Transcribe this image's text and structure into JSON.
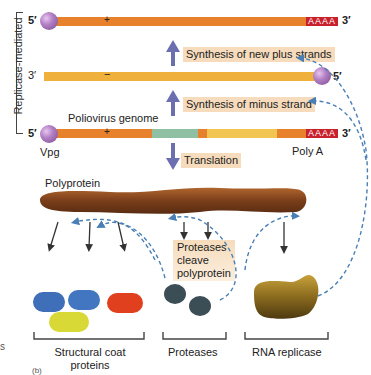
{
  "side_label": "Replicase-mediated",
  "strands": {
    "new_plus": {
      "five_prime": "5′",
      "sign": "+",
      "polyA": "AAAA",
      "three_prime": "3′"
    },
    "minus": {
      "three_prime": "3′",
      "sign": "−",
      "five_prime": "5′"
    },
    "genome": {
      "five_prime": "5′",
      "sign": "+",
      "polyA": "AAAA",
      "three_prime": "3′",
      "label": "Poliovirus genome",
      "vpg_label": "Vpg",
      "polya_label": "Poly A"
    }
  },
  "steps": {
    "plus_synthesis": "Synthesis of new plus strands",
    "minus_synthesis": "Synthesis of minus strand",
    "translation": "Translation",
    "cleavage_line1": "Proteases",
    "cleavage_line2": "cleave",
    "cleavage_line3": "polyprotein"
  },
  "polyprotein_label": "Polyprotein",
  "products": {
    "structural_line1": "Structural coat",
    "structural_line2": "proteins",
    "proteases": "Proteases",
    "replicase": "RNA replicase"
  },
  "edge_text": {
    "left_s": "s",
    "panel": "(b)"
  },
  "colors": {
    "plus_strand": "#e8812c",
    "minus_strand": "#f0b03c",
    "green_segment": "#8fc0a4",
    "yellow_segment": "#f2c450",
    "polyA": "#c8202c",
    "arrow": "#6b6fb0",
    "dashed": "#4a7fb5",
    "label_bg": "#f6dcbc",
    "polyprotein": "#8a4a22",
    "coat_blue": "#3f6fb8",
    "coat_red": "#e0401e",
    "coat_yellow": "#d8d836",
    "protease": "#3b4d55",
    "replicase": "#8a6a1e"
  }
}
